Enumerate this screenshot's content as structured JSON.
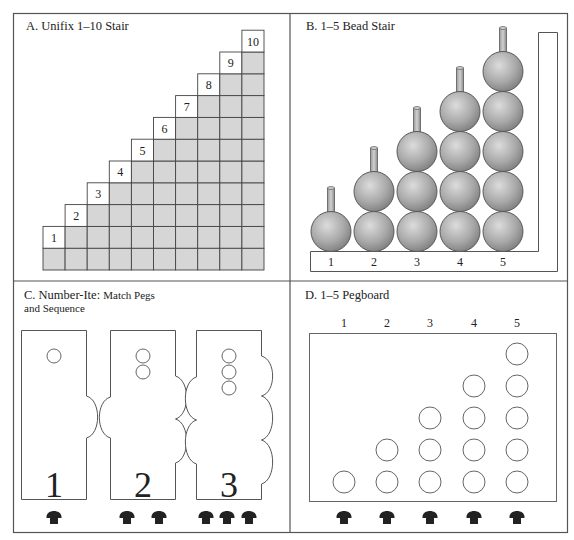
{
  "colors": {
    "frame": "#555555",
    "grid_line": "#444444",
    "cube_fill": "#d6d6d6",
    "label_cell_fill": "#ffffff",
    "bead_light": "#d4d4d4",
    "bead_dark": "#8a8a8a",
    "bead_outline": "#5a5a5a",
    "peg_fill": "#222222",
    "hole_stroke": "#555555"
  },
  "panels": {
    "a": {
      "title": "A. Unifix 1–10 Stair",
      "stair_counts": [
        1,
        2,
        3,
        4,
        5,
        6,
        7,
        8,
        9,
        10
      ],
      "labels": [
        "1",
        "2",
        "3",
        "4",
        "5",
        "6",
        "7",
        "8",
        "9",
        "10"
      ]
    },
    "b": {
      "title": "B. 1–5 Bead Stair",
      "columns": [
        {
          "label": "1",
          "beads": 1
        },
        {
          "label": "2",
          "beads": 2
        },
        {
          "label": "3",
          "beads": 3
        },
        {
          "label": "4",
          "beads": 4
        },
        {
          "label": "5",
          "beads": 5
        }
      ]
    },
    "c": {
      "title_main": "C. Number-Ite:",
      "title_sub_1": "Match Pegs",
      "title_sub_2": "and Sequence",
      "cards": [
        {
          "numeral": "1",
          "holes": 1,
          "left_bumps": 0,
          "right_bumps": 1,
          "pegs": 1
        },
        {
          "numeral": "2",
          "holes": 2,
          "left_bumps": 1,
          "right_bumps": 2,
          "pegs": 2
        },
        {
          "numeral": "3",
          "holes": 3,
          "left_bumps": 2,
          "right_bumps": 3,
          "pegs": 3
        }
      ]
    },
    "d": {
      "title": "D. 1–5 Pegboard",
      "columns": [
        {
          "label": "1",
          "holes": 1
        },
        {
          "label": "2",
          "holes": 2
        },
        {
          "label": "3",
          "holes": 3
        },
        {
          "label": "4",
          "holes": 4
        },
        {
          "label": "5",
          "holes": 5
        }
      ],
      "pegs_below": 5
    }
  }
}
